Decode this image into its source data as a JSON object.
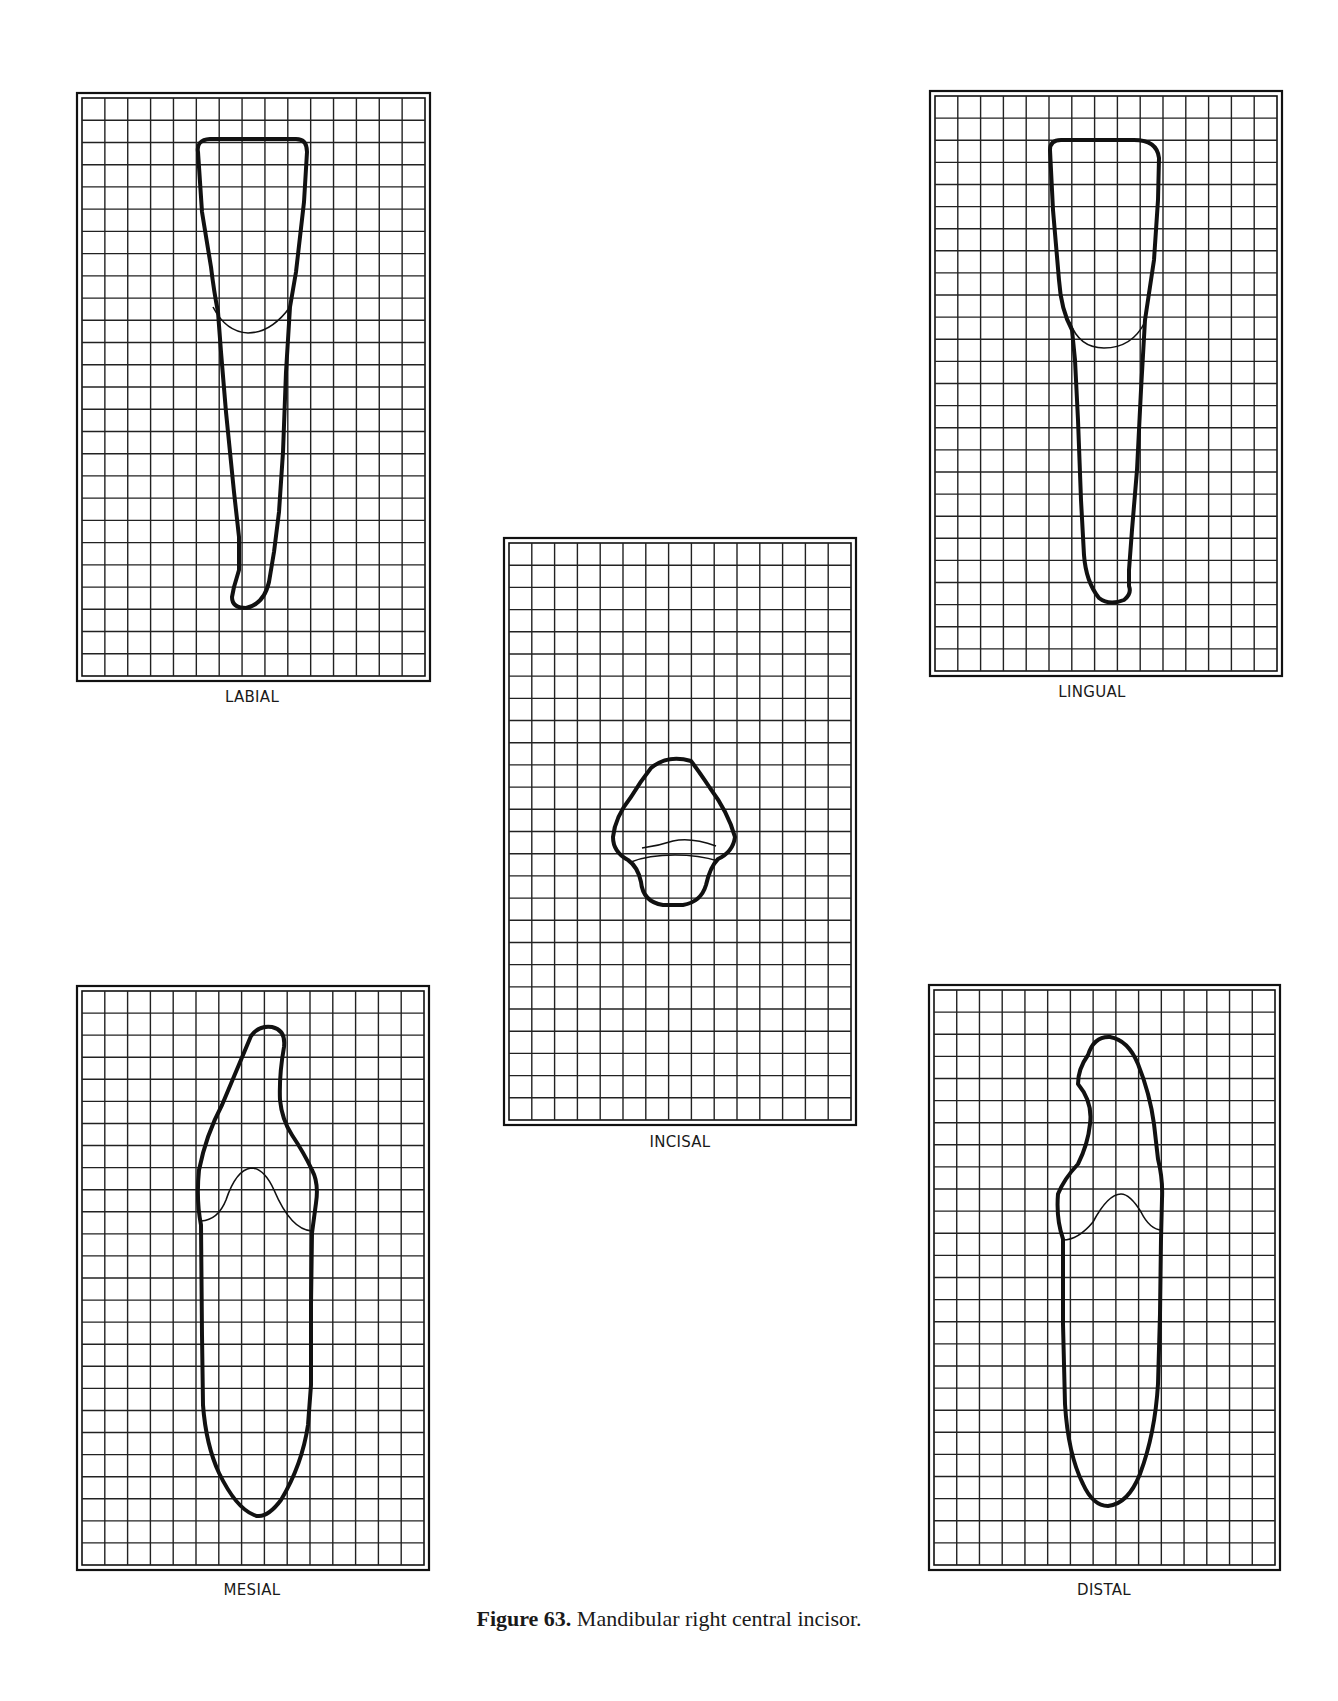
{
  "figure": {
    "number_label": "Figure 63.",
    "title": "Mandibular right central incisor."
  },
  "panels": {
    "labial": {
      "label": "LABIAL",
      "x": 76,
      "y": 92,
      "w": 355,
      "h": 590,
      "label_x": 252,
      "label_y": 688
    },
    "lingual": {
      "label": "LINGUAL",
      "x": 929,
      "y": 90,
      "w": 354,
      "h": 587,
      "label_x": 1092,
      "label_y": 683
    },
    "incisal": {
      "label": "INCISAL",
      "x": 503,
      "y": 537,
      "w": 354,
      "h": 589,
      "label_x": 680,
      "label_y": 1133
    },
    "mesial": {
      "label": "MESIAL",
      "x": 76,
      "y": 985,
      "w": 354,
      "h": 586,
      "label_x": 252,
      "label_y": 1581
    },
    "distal": {
      "label": "DISTAL",
      "x": 928,
      "y": 984,
      "w": 353,
      "h": 587,
      "label_x": 1104,
      "label_y": 1581
    }
  },
  "grid": {
    "columns": 15,
    "rows": 26,
    "line_color": "#222222",
    "outline_color": "#111111"
  }
}
